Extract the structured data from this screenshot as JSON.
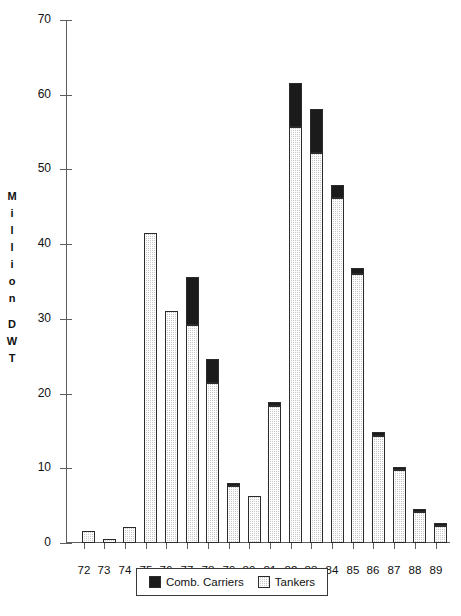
{
  "chart_data": {
    "type": "bar",
    "title": "",
    "subtitle": "",
    "xlabel": "",
    "ylabel": "Million DWT",
    "ylabel_letters": [
      "M",
      "i",
      "l",
      "l",
      "i",
      "o",
      "n",
      "",
      "D",
      "W",
      "T"
    ],
    "categories": [
      "72",
      "73",
      "74",
      "75",
      "76",
      "77",
      "78",
      "79",
      "80",
      "81",
      "82",
      "83",
      "84",
      "85",
      "86",
      "87",
      "88",
      "89"
    ],
    "series": [
      {
        "name": "Tankers",
        "color": "#c8c8c8",
        "pattern": "dotted-hatch",
        "values": [
          1.6,
          0.6,
          2.1,
          41.5,
          31.0,
          29.2,
          21.4,
          7.6,
          6.3,
          18.3,
          55.7,
          52.2,
          46.2,
          36.0,
          14.3,
          9.8,
          4.1,
          2.3
        ]
      },
      {
        "name": "Comb. Carriers",
        "color": "#1b1b1b",
        "pattern": "solid",
        "values": [
          0.0,
          0.0,
          0.0,
          0.0,
          0.0,
          6.4,
          3.2,
          0.4,
          0.0,
          0.6,
          5.9,
          5.9,
          1.7,
          0.8,
          0.5,
          0.4,
          0.2,
          0.2
        ]
      }
    ],
    "totals": [
      1.6,
      0.6,
      2.1,
      41.5,
      31.0,
      35.6,
      24.6,
      8.0,
      6.3,
      18.9,
      61.6,
      58.1,
      47.9,
      36.8,
      14.8,
      10.2,
      4.3,
      2.5
    ],
    "stacked": true,
    "ylim": [
      0,
      70
    ],
    "yticks": [
      0,
      10,
      20,
      30,
      40,
      50,
      60,
      70
    ],
    "ytick_labels": [
      "0",
      "10",
      "20",
      "30",
      "40",
      "50",
      "60",
      "70"
    ],
    "grid": false,
    "legend": {
      "position": "bottom",
      "entries": [
        {
          "label": "Comb. Carriers",
          "swatch": "black-solid"
        },
        {
          "label": "Tankers",
          "swatch": "gray-hatch"
        }
      ]
    },
    "caption": ""
  }
}
